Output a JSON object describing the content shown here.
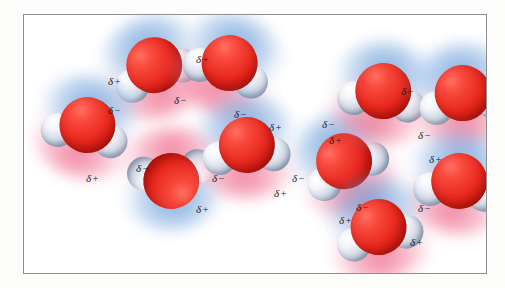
{
  "figure": {
    "frame_border_color": "#8d8d93",
    "background_color": "#ffffff"
  },
  "legend_symbols": {
    "delta": "δ",
    "partial_positive": "+",
    "partial_negative": "−"
  },
  "colors": {
    "oxygen": "#e8291f",
    "hydrogen": "#cfd6e3",
    "negative_halo": "#6096d6",
    "positive_halo": "#ed5c7e",
    "label_text": "#1b1b1b"
  },
  "molecules": [
    {
      "id": "mol-1",
      "name": "water-molecule-top-left",
      "x": 88,
      "y": 14,
      "rotate": -22
    },
    {
      "id": "mol-2",
      "name": "water-molecule-left",
      "x": 20,
      "y": 74,
      "rotate": 12
    },
    {
      "id": "mol-3",
      "name": "water-molecule-top-mid",
      "x": 162,
      "y": 12,
      "rotate": 18
    },
    {
      "id": "mol-4",
      "name": "water-molecule-lower-left",
      "x": 104,
      "y": 126,
      "rotate": 172
    },
    {
      "id": "mol-5",
      "name": "water-molecule-center",
      "x": 180,
      "y": 94,
      "rotate": -4
    },
    {
      "id": "mol-6",
      "name": "water-molecule-mid-right",
      "x": 278,
      "y": 110,
      "rotate": -28
    },
    {
      "id": "mol-7",
      "name": "water-molecule-upper-right",
      "x": 316,
      "y": 40,
      "rotate": 8
    },
    {
      "id": "mol-8",
      "name": "water-molecule-far-right-top",
      "x": 396,
      "y": 42,
      "rotate": -8
    },
    {
      "id": "mol-9",
      "name": "water-molecule-far-right-bottom",
      "x": 392,
      "y": 130,
      "rotate": 6
    },
    {
      "id": "mol-10",
      "name": "water-molecule-bottom-right",
      "x": 312,
      "y": 176,
      "rotate": -14
    }
  ],
  "charge_labels": [
    {
      "id": "lbl-1",
      "name": "charge-label-delta-plus-1",
      "delta": "δ",
      "sign": "+",
      "x": 84,
      "y": 61
    },
    {
      "id": "lbl-2",
      "name": "charge-label-delta-minus-1",
      "delta": "δ",
      "sign": "−",
      "x": 84,
      "y": 90
    },
    {
      "id": "lbl-3",
      "name": "charge-label-delta-plus-2",
      "delta": "δ",
      "sign": "+",
      "x": 172,
      "y": 39
    },
    {
      "id": "lbl-4",
      "name": "charge-label-delta-minus-2",
      "delta": "δ",
      "sign": "−",
      "x": 150,
      "y": 80
    },
    {
      "id": "lbl-5",
      "name": "charge-label-delta-minus-3",
      "delta": "δ",
      "sign": "−",
      "x": 210,
      "y": 94
    },
    {
      "id": "lbl-6",
      "name": "charge-label-delta-plus-3",
      "delta": "δ",
      "sign": "+",
      "x": 245,
      "y": 107
    },
    {
      "id": "lbl-7",
      "name": "charge-label-delta-plus-4",
      "delta": "δ",
      "sign": "+",
      "x": 62,
      "y": 158
    },
    {
      "id": "lbl-8",
      "name": "charge-label-delta-minus-4",
      "delta": "δ",
      "sign": "−",
      "x": 112,
      "y": 148
    },
    {
      "id": "lbl-9",
      "name": "charge-label-delta-minus-5",
      "delta": "δ",
      "sign": "−",
      "x": 188,
      "y": 158
    },
    {
      "id": "lbl-10",
      "name": "charge-label-delta-plus-5",
      "delta": "δ",
      "sign": "+",
      "x": 172,
      "y": 189
    },
    {
      "id": "lbl-11",
      "name": "charge-label-delta-minus-6",
      "delta": "δ",
      "sign": "−",
      "x": 268,
      "y": 158
    },
    {
      "id": "lbl-12",
      "name": "charge-label-delta-plus-6",
      "delta": "δ",
      "sign": "+",
      "x": 250,
      "y": 173
    },
    {
      "id": "lbl-13",
      "name": "charge-label-delta-plus-7",
      "delta": "δ",
      "sign": "+",
      "x": 305,
      "y": 120
    },
    {
      "id": "lbl-14",
      "name": "charge-label-delta-minus-7",
      "delta": "δ",
      "sign": "−",
      "x": 298,
      "y": 104
    },
    {
      "id": "lbl-15",
      "name": "charge-label-delta-plus-8",
      "delta": "δ",
      "sign": "+",
      "x": 377,
      "y": 71
    },
    {
      "id": "lbl-16",
      "name": "charge-label-delta-minus-8",
      "delta": "δ",
      "sign": "−",
      "x": 394,
      "y": 115
    },
    {
      "id": "lbl-17",
      "name": "charge-label-delta-plus-9",
      "delta": "δ",
      "sign": "+",
      "x": 405,
      "y": 139
    },
    {
      "id": "lbl-18",
      "name": "charge-label-delta-minus-9",
      "delta": "δ",
      "sign": "−",
      "x": 394,
      "y": 188
    },
    {
      "id": "lbl-19",
      "name": "charge-label-delta-minus-10",
      "delta": "δ",
      "sign": "−",
      "x": 332,
      "y": 187
    },
    {
      "id": "lbl-20",
      "name": "charge-label-delta-plus-10",
      "delta": "δ",
      "sign": "+",
      "x": 315,
      "y": 200
    },
    {
      "id": "lbl-21",
      "name": "charge-label-delta-plus-11",
      "delta": "δ",
      "sign": "+",
      "x": 386,
      "y": 222
    }
  ]
}
